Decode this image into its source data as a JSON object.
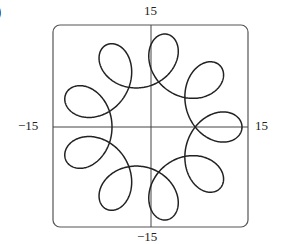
{
  "panel": {
    "label": ")"
  },
  "chart_data": {
    "type": "line",
    "title": "",
    "xlabel": "",
    "ylabel": "",
    "xlim": [
      -15,
      15
    ],
    "ylim": [
      -15,
      15
    ],
    "grid": false,
    "axes": "crossing at origin",
    "tick_labels": {
      "x_min": "−15",
      "x_max": "15",
      "y_min": "−15",
      "y_max": "15"
    },
    "series": [
      {
        "name": "parametric curve",
        "equation_approx": "x = 10cos t + 4cos(8t), y = 10sin t − 4sin(8t), 0 ≤ t ≤ 2π",
        "loops": 9,
        "outer_radius": 14,
        "color": "#222222"
      }
    ]
  }
}
